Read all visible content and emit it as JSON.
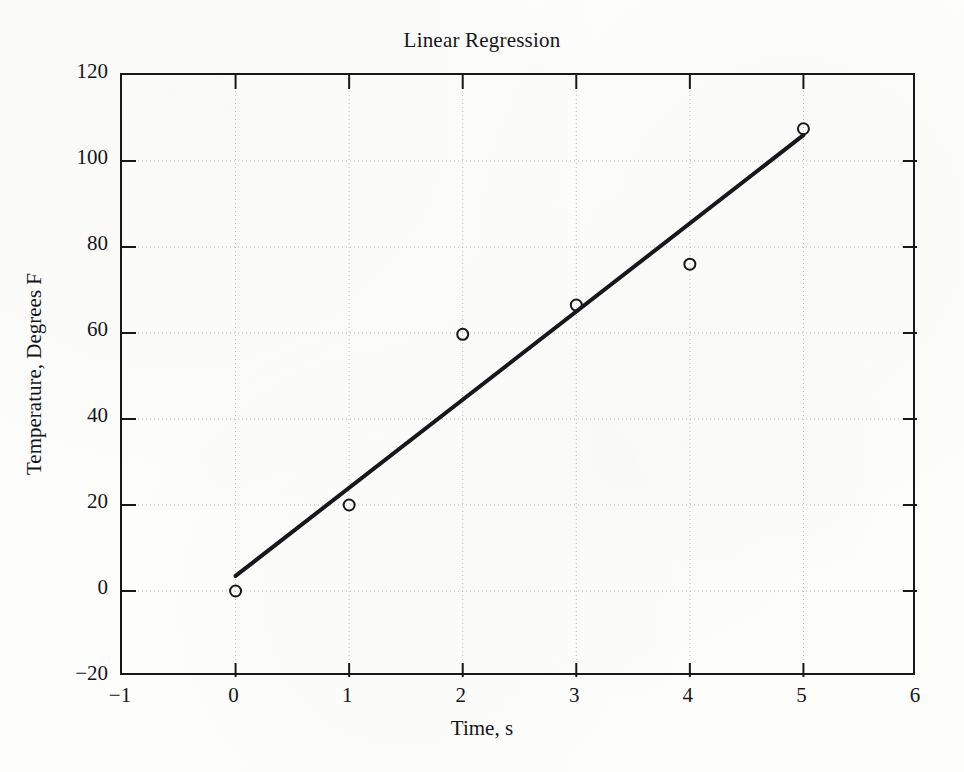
{
  "figure": {
    "title": "Linear Regression",
    "background_color": "#fdfdfb",
    "ink_color": "#18181c",
    "grid_color": "#b9b9b9"
  },
  "chart_data": {
    "type": "scatter",
    "title": "Linear Regression",
    "xlabel": "Time, s",
    "ylabel": "Temperature, Degrees F",
    "xlim": [
      -1,
      6
    ],
    "ylim": [
      -20,
      120
    ],
    "xticks": [
      -1,
      0,
      1,
      2,
      3,
      4,
      5,
      6
    ],
    "xtick_labels": [
      "−1",
      "0",
      "1",
      "2",
      "3",
      "4",
      "5",
      "6"
    ],
    "yticks": [
      -20,
      0,
      20,
      40,
      60,
      80,
      100,
      120
    ],
    "ytick_labels": [
      "−20",
      "0",
      "20",
      "40",
      "60",
      "80",
      "100",
      "120"
    ],
    "grid": true,
    "grid_style": "dotted",
    "legend": null,
    "series": [
      {
        "name": "Measured data",
        "type": "scatter",
        "marker": "open-circle",
        "x": [
          0,
          1,
          2,
          3,
          4,
          5
        ],
        "y": [
          0,
          20,
          59.7,
          66.5,
          76,
          107.5
        ]
      },
      {
        "name": "Least-squares fit",
        "type": "line",
        "x": [
          0,
          5
        ],
        "y": [
          3.5,
          106
        ],
        "slope": 20.5,
        "intercept": 3.5,
        "linewidth": 4
      }
    ]
  }
}
